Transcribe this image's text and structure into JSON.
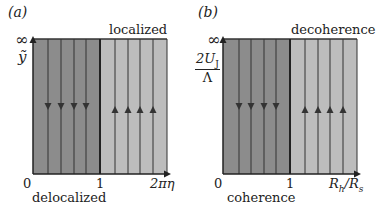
{
  "panels": [
    {
      "tag": "(a)",
      "top_region_label": "localized",
      "bottom_region_label": "delocalized",
      "y_axis": {
        "top_tick": "∞",
        "label": "ỹ"
      },
      "x_axis": {
        "ticks": [
          "0",
          "1"
        ],
        "label": "2πη"
      },
      "regions": [
        {
          "name": "delocalized",
          "color": "#8c8c8c",
          "x_range": [
            0,
            1
          ],
          "flow_direction": "down",
          "lines": 4
        },
        {
          "name": "localized",
          "color": "#bdbdbd",
          "x_range": [
            1,
            "2πη"
          ],
          "flow_direction": "up",
          "lines": 4
        }
      ]
    },
    {
      "tag": "(b)",
      "top_region_label": "decoherence",
      "bottom_region_label": "coherence",
      "y_axis": {
        "top_tick": "∞",
        "label_num": "2U",
        "label_sub": "J",
        "label_den": "Λ"
      },
      "x_axis": {
        "ticks": [
          "0",
          "1"
        ],
        "label": "R",
        "label_sub1": "h",
        "label_mid": "/R",
        "label_sub2": "s"
      },
      "regions": [
        {
          "name": "coherence",
          "color": "#8c8c8c",
          "x_range": [
            0,
            1
          ],
          "flow_direction": "down",
          "lines": 4
        },
        {
          "name": "decoherence",
          "color": "#bdbdbd",
          "x_range": [
            1,
            "∞"
          ],
          "flow_direction": "up",
          "lines": 4
        }
      ]
    }
  ],
  "colors": {
    "dark_region": "#8c8c8c",
    "light_region": "#bdbdbd",
    "line": "#333333"
  }
}
